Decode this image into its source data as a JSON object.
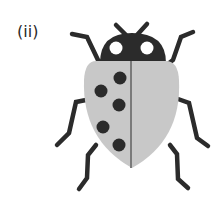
{
  "figure": {
    "label": "(ii)",
    "colors": {
      "dark": "#2b2b2b",
      "shell": "#c8c8c8",
      "seam": "#7a7a7a",
      "eye": "#ffffff"
    }
  }
}
